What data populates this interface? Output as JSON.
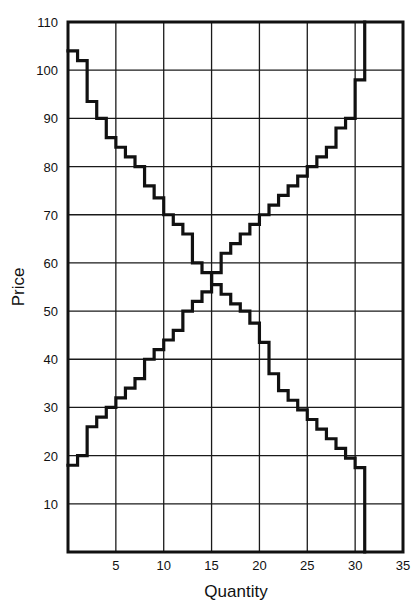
{
  "chart_data": {
    "type": "line",
    "subtype": "step",
    "title": "",
    "xlabel": "Quantity",
    "ylabel": "Price",
    "xlim": [
      0,
      35
    ],
    "ylim": [
      0,
      110
    ],
    "x_ticks": [
      5,
      10,
      15,
      20,
      25,
      30,
      35
    ],
    "y_ticks": [
      10,
      20,
      30,
      40,
      50,
      60,
      70,
      80,
      90,
      100,
      110
    ],
    "grid": true,
    "legend": null,
    "series": [
      {
        "name": "Demand",
        "direction": "downward-sloping",
        "step_start_quantity": 0,
        "values": [
          104,
          102,
          93.5,
          90,
          86,
          84,
          82,
          80,
          76,
          73.5,
          70,
          68,
          66,
          60,
          58,
          55.5,
          53.5,
          51.5,
          50,
          47.5,
          43.5,
          37,
          33.5,
          31.5,
          29.5,
          27.5,
          25.5,
          23.5,
          21.5,
          19.5,
          17.5
        ],
        "end_quantity": 31,
        "end_price": 0
      },
      {
        "name": "Supply",
        "direction": "upward-sloping",
        "step_start_quantity": 0,
        "values": [
          18,
          20,
          26,
          28,
          30,
          32,
          34,
          36,
          40,
          42,
          44,
          46,
          50,
          52,
          54,
          58,
          62,
          64,
          66,
          68,
          70,
          72,
          74,
          76,
          78,
          80,
          82,
          84,
          88,
          90,
          98,
          104
        ],
        "end_quantity": 31,
        "end_price": 110
      }
    ],
    "intersection": {
      "quantity": 15,
      "price": 56
    }
  },
  "axes": {
    "xlabel": "Quantity",
    "ylabel": "Price",
    "x_tick_labels": [
      "5",
      "10",
      "15",
      "20",
      "25",
      "30",
      "35"
    ],
    "y_tick_labels": [
      "10",
      "20",
      "30",
      "40",
      "50",
      "60",
      "70",
      "80",
      "90",
      "100",
      "110"
    ]
  },
  "colors": {
    "line": "#111111",
    "grid": "#1a1a1a",
    "background": "#ffffff"
  }
}
